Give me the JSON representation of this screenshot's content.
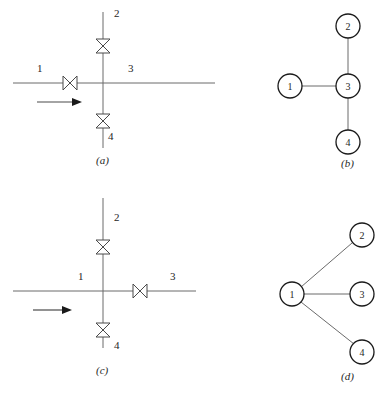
{
  "figure": {
    "background_color": "#ffffff",
    "line_color": "#6b6b6b",
    "dark_line_color": "#4a4a4a",
    "node_stroke_color": "#1a1a1a",
    "text_color": "#262626",
    "width": 387,
    "height": 410
  },
  "panels": [
    {
      "id": "a",
      "caption": "(a)",
      "type": "piping-schematic",
      "description": "Cross junction of four pipes with valve on branch 1, branch 2 and branch 4; flow arrow on branch 1",
      "pipe_labels": [
        "1",
        "2",
        "3",
        "4"
      ],
      "valves": [
        {
          "on_branch": "1",
          "orientation": "horizontal"
        },
        {
          "on_branch": "2",
          "orientation": "vertical"
        },
        {
          "on_branch": "4",
          "orientation": "vertical"
        }
      ],
      "flow_arrow": {
        "direction": "right",
        "on_branch": "1"
      }
    },
    {
      "id": "b",
      "caption": "(b)",
      "type": "graph",
      "description": "Star graph with node 3 as hub",
      "nodes": [
        "1",
        "2",
        "3",
        "4"
      ],
      "hub": "3",
      "edges": [
        [
          "1",
          "3"
        ],
        [
          "2",
          "3"
        ],
        [
          "3",
          "4"
        ]
      ]
    },
    {
      "id": "c",
      "caption": "(c)",
      "type": "piping-schematic",
      "description": "Cross junction of four pipes with valve on branch 3, branch 2 and branch 4; flow arrow on branch 1",
      "pipe_labels": [
        "1",
        "2",
        "3",
        "4"
      ],
      "valves": [
        {
          "on_branch": "3",
          "orientation": "horizontal"
        },
        {
          "on_branch": "2",
          "orientation": "vertical"
        },
        {
          "on_branch": "4",
          "orientation": "vertical"
        }
      ],
      "flow_arrow": {
        "direction": "right",
        "on_branch": "1"
      }
    },
    {
      "id": "d",
      "caption": "(d)",
      "type": "graph",
      "description": "Star graph with node 1 as hub",
      "nodes": [
        "1",
        "2",
        "3",
        "4"
      ],
      "hub": "1",
      "edges": [
        [
          "1",
          "2"
        ],
        [
          "1",
          "3"
        ],
        [
          "1",
          "4"
        ]
      ]
    }
  ],
  "panel_a": {
    "label_1": "1",
    "label_2": "2",
    "label_3": "3",
    "label_4": "4",
    "caption": "(a)"
  },
  "panel_b": {
    "node_1": "1",
    "node_2": "2",
    "node_3": "3",
    "node_4": "4",
    "caption": "(b)"
  },
  "panel_c": {
    "label_1": "1",
    "label_2": "2",
    "label_3": "3",
    "label_4": "4",
    "caption": "(c)"
  },
  "panel_d": {
    "node_1": "1",
    "node_2": "2",
    "node_3": "3",
    "node_4": "4",
    "caption": "(d)"
  }
}
